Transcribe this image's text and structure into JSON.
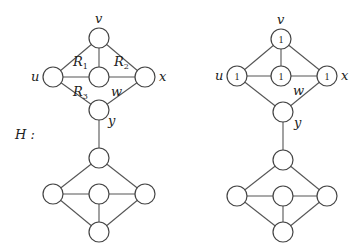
{
  "graph_label": "H :",
  "left_graph": {
    "vertex_labels": {
      "v": "v",
      "u": "u",
      "w": "w",
      "x": "x",
      "y": "y"
    },
    "region_labels": [
      "R1",
      "R2",
      "R3"
    ]
  },
  "right_graph": {
    "vertex_labels": {
      "v": "v",
      "u": "u",
      "w": "w",
      "x": "x",
      "y": "y"
    },
    "vertex_values": {
      "v": "1",
      "u": "1",
      "w": "1",
      "x": "1"
    }
  }
}
